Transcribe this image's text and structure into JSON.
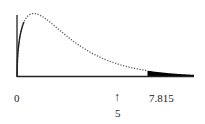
{
  "chart_data": {
    "type": "area",
    "title": "",
    "distribution": "chi-square",
    "degrees_of_freedom": 3,
    "critical_value": 7.815,
    "test_statistic": 5,
    "shaded_region": {
      "from": 7.815,
      "to": "infinity",
      "color": "#000000"
    },
    "xlabel": "",
    "ylabel": "",
    "grid": false,
    "legend": null,
    "axis": {
      "x_origin_label": "0"
    },
    "annotations": [
      {
        "text": "0",
        "x": 0,
        "position": "below-axis"
      },
      {
        "text": "↑",
        "x": 5,
        "position": "below-axis"
      },
      {
        "text": "5",
        "x": 5,
        "position": "below-arrow"
      },
      {
        "text": "7.815",
        "x": 7.815,
        "position": "below-axis"
      }
    ],
    "colors": {
      "curve": "#444444",
      "axis": "#222222",
      "shade": "#000000",
      "background": "#ffffff"
    }
  },
  "labels": {
    "origin": "0",
    "arrow": "↑",
    "statistic": "5",
    "critical": "7.815"
  }
}
